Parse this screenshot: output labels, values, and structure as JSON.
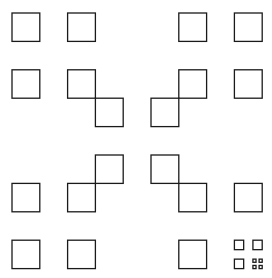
{
  "figure": {
    "type": "vicsek-x-fractal",
    "stroke_color": "#1a1a1a",
    "background_color": "#ffffff",
    "grid": {
      "cols": 9,
      "rows": 9,
      "x0": 12,
      "y0": 13,
      "cell_w": 27.8,
      "cell_h": 28.4
    },
    "squares": [
      [
        0,
        0
      ],
      [
        2,
        0
      ],
      [
        0,
        2
      ],
      [
        2,
        2
      ],
      [
        6,
        0
      ],
      [
        8,
        0
      ],
      [
        6,
        2
      ],
      [
        8,
        2
      ],
      [
        0,
        6
      ],
      [
        2,
        6
      ],
      [
        0,
        8
      ],
      [
        2,
        8
      ],
      [
        3,
        3
      ],
      [
        5,
        3
      ],
      [
        3,
        5
      ],
      [
        5,
        5
      ],
      [
        6,
        6
      ],
      [
        8,
        6
      ],
      [
        6,
        8
      ]
    ],
    "subdivided_cell": {
      "cell": [
        8,
        8
      ],
      "squares": [
        [
          0,
          0
        ],
        [
          2,
          0
        ],
        [
          0,
          2
        ]
      ],
      "subdivided_cell": {
        "cell": [
          2,
          2
        ],
        "squares": [
          [
            0,
            0
          ],
          [
            2,
            0
          ],
          [
            0,
            2
          ],
          [
            2,
            2
          ]
        ]
      }
    }
  }
}
